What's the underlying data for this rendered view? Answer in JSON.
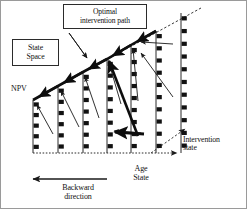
{
  "figure": {
    "title_box": {
      "label": "Optimal\nintervention path",
      "name": "optimal-intervention-path"
    },
    "state_space_box": {
      "label": "State\nSpace",
      "name": "state-space"
    },
    "axis_labels": {
      "npv": "NPV",
      "age_state": "Age\nState",
      "intervention_state": "Intervention\nstate",
      "backward_direction": "Backward\ndirection"
    },
    "colors": {
      "stroke": "#1a1a1a",
      "marker": "#111111",
      "background": "#ffffff",
      "border": "#9a9a9a",
      "dashed": "#3a3a3a"
    }
  },
  "chart_data": {
    "type": "diagram-schematic",
    "title": "Optimal intervention path",
    "xlabel": "Age State",
    "ylabel": "NPV",
    "zlabel": "Intervention state",
    "grid": false,
    "legend": "none",
    "axis_origin": [
      32,
      152
    ],
    "x_axis_end": [
      178,
      152
    ],
    "diagonal_start": [
      32,
      99
    ],
    "diagonal_end": [
      200,
      7
    ],
    "columns": [
      {
        "name": "column-1",
        "x": 32,
        "top": 99,
        "bottom": 152,
        "markers": 5
      },
      {
        "name": "column-2",
        "x": 57,
        "top": 85,
        "bottom": 152,
        "markers": 6
      },
      {
        "name": "column-3",
        "x": 82,
        "top": 71,
        "bottom": 152,
        "markers": 7
      },
      {
        "name": "column-4",
        "x": 106,
        "top": 58,
        "bottom": 152,
        "markers": 8
      },
      {
        "name": "column-5",
        "x": 130,
        "top": 44,
        "bottom": 152,
        "markers": 9
      },
      {
        "name": "column-6",
        "x": 155,
        "top": 30,
        "bottom": 152,
        "markers": 10
      },
      {
        "name": "column-7",
        "x": 180,
        "top": 12,
        "bottom": 152,
        "markers": 11
      }
    ],
    "optimal_path_nodes": [
      [
        32,
        99
      ],
      [
        57,
        85
      ],
      [
        82,
        71
      ],
      [
        106,
        58
      ],
      [
        130,
        44
      ],
      [
        155,
        30
      ]
    ],
    "intervention_arrows": [
      {
        "from": [
          52,
          133
        ],
        "to": [
          36,
          104
        ]
      },
      {
        "from": [
          78,
          126
        ],
        "to": [
          60,
          90
        ]
      },
      {
        "from": [
          98,
          117
        ],
        "to": [
          84,
          76
        ]
      },
      {
        "from": [
          120,
          103
        ],
        "to": [
          108,
          62
        ]
      },
      {
        "from": [
          137,
          100
        ],
        "to": [
          132,
          48
        ]
      },
      {
        "from": [
          172,
          43
        ],
        "to": [
          140,
          41
        ]
      },
      {
        "from": [
          172,
          96
        ],
        "to": [
          140,
          52
        ]
      },
      {
        "from": [
          140,
          132
        ],
        "to": [
          113,
          130
        ]
      },
      {
        "from": [
          68,
          32
        ],
        "to": [
          86,
          57
        ]
      }
    ]
  }
}
